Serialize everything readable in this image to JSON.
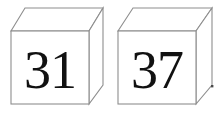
{
  "canvas": {
    "width": 224,
    "height": 114,
    "background_color": "#ffffff"
  },
  "style": {
    "edge_color": "#8e8e8e",
    "face_color": "#ffffff",
    "label_color": "#111111",
    "speck_color": "#4a4a4a"
  },
  "cubes": [
    {
      "name": "cube-left",
      "label": "31",
      "front_face": {
        "x": 11,
        "y": 31,
        "width": 78,
        "height": 73
      },
      "depth_offset": {
        "dx": 14,
        "dy": -23
      }
    },
    {
      "name": "cube-right",
      "label": "37",
      "front_face": {
        "x": 118,
        "y": 31,
        "width": 78,
        "height": 73
      },
      "depth_offset": {
        "dx": 16,
        "dy": -23
      }
    }
  ],
  "artifacts": [
    {
      "name": "speck",
      "x": 211,
      "y": 85,
      "size": 2.4
    }
  ]
}
